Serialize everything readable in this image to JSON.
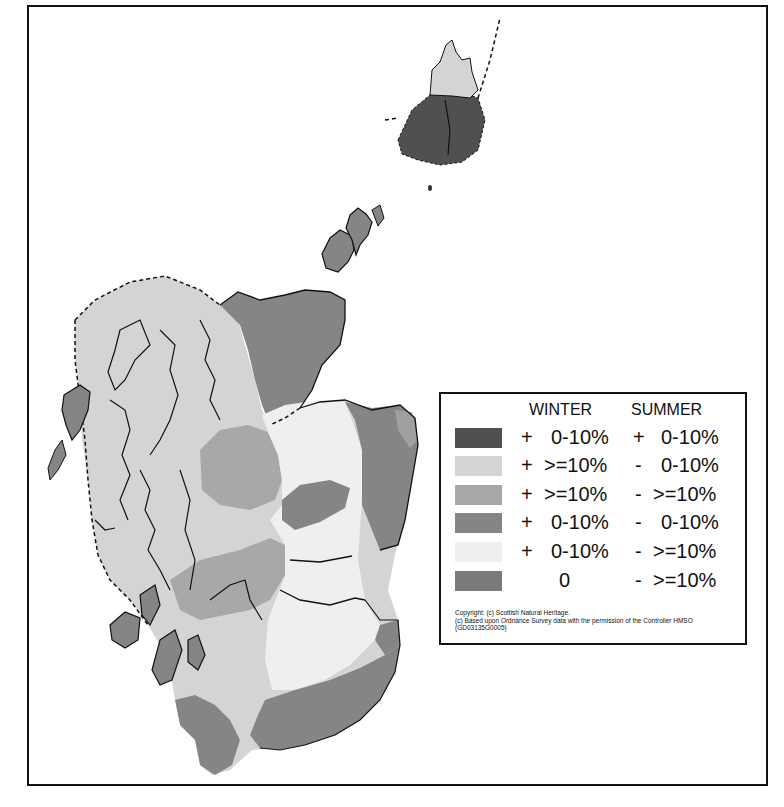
{
  "map": {
    "title": "Scotland seasonal precipitation change map",
    "colors": {
      "dark": "#505050",
      "light_gray": "#d4d4d4",
      "mid_gray": "#a8a8a8",
      "medium_dark": "#858585",
      "very_light": "#efefef",
      "gray_zero": "#7a7a7a",
      "outline": "#111111"
    }
  },
  "legend": {
    "header_winter": "WINTER",
    "header_summer": "SUMMER",
    "rows": [
      {
        "color": "#505050",
        "winter_sign": "+",
        "winter_value": "0-10%",
        "summer_sign": "+",
        "summer_value": "0-10%"
      },
      {
        "color": "#d4d4d4",
        "winter_sign": "+",
        "winter_value": ">=10%",
        "summer_sign": "-",
        "summer_value": "0-10%"
      },
      {
        "color": "#a8a8a8",
        "winter_sign": "+",
        "winter_value": ">=10%",
        "summer_sign": "-",
        "summer_value": ">=10%"
      },
      {
        "color": "#858585",
        "winter_sign": "+",
        "winter_value": "0-10%",
        "summer_sign": "-",
        "summer_value": "0-10%"
      },
      {
        "color": "#efefef",
        "winter_sign": "+",
        "winter_value": "0-10%",
        "summer_sign": "-",
        "summer_value": ">=10%"
      },
      {
        "color": "#7a7a7a",
        "winter_sign": "",
        "winter_value": "0",
        "summer_sign": "-",
        "summer_value": ">=10%"
      }
    ],
    "copyright_line1": "Copyright: (c) Scottish Natural Heritage.",
    "copyright_line2": "(c) Based upon Ordnance Survey data with the permission of the Controller HMSO",
    "copyright_line3": "(GD03135G0005)"
  }
}
